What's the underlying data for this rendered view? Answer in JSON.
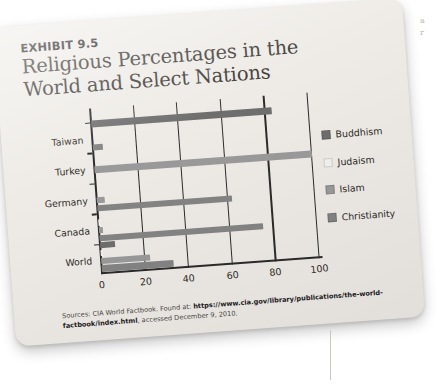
{
  "exhibit": {
    "label": "EXHIBIT 9.5",
    "title": "Religious Percentages in the World and Select Nations"
  },
  "source": {
    "prefix": "Sources: CIA World Factbook. Found at: ",
    "url_part1": "https://www.cia.gov/library/publications/the-world-factbook/",
    "url_part2": "index.html",
    "suffix": ", accessed December 9, 2010."
  },
  "edge_marks": {
    "mark_a": "a",
    "mark_b": "r"
  },
  "colors": {
    "buddhism": "#6e6e6e",
    "judaism": "#f2f2f0",
    "islam": "#9a9a9a",
    "christianity": "#848484",
    "axis": "#2b2b2b",
    "card": "#eeebe6"
  },
  "chart_data": {
    "type": "bar",
    "orientation": "horizontal",
    "title": "Religious Percentages in the World and Select Nations",
    "xlabel": "",
    "ylabel": "",
    "xlim": [
      0,
      100
    ],
    "xticks": [
      0,
      20,
      40,
      60,
      80,
      100
    ],
    "grid": true,
    "legend_position": "right",
    "categories": [
      "Taiwan",
      "Turkey",
      "Germany",
      "Canada",
      "World"
    ],
    "series": [
      {
        "name": "Buddhism",
        "color": "#6e6e6e",
        "values": [
          83.0,
          0.0,
          0.0,
          0.0,
          6.8
        ]
      },
      {
        "name": "Judaism",
        "color": "#f2f2f0",
        "values": [
          0.0,
          0.0,
          0.0,
          1.1,
          0.2
        ]
      },
      {
        "name": "Islam",
        "color": "#9a9a9a",
        "values": [
          0.0,
          99.8,
          3.7,
          2.0,
          22.5
        ]
      },
      {
        "name": "Christianity",
        "color": "#848484",
        "values": [
          4.5,
          0.0,
          62.0,
          75.0,
          33.0
        ]
      }
    ]
  },
  "legend": {
    "items": [
      {
        "label": "Buddhism"
      },
      {
        "label": "Judaism"
      },
      {
        "label": "Islam"
      },
      {
        "label": "Christianity"
      }
    ]
  }
}
